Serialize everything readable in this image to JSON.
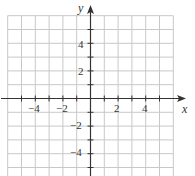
{
  "chart_data": {
    "type": "scatter",
    "title": "",
    "xlabel": "x",
    "ylabel": "y",
    "xlim": [
      -6,
      6
    ],
    "ylim": [
      -6,
      6
    ],
    "grid": true,
    "grid_step": 1,
    "x_tick_labels": [
      "-4",
      "-2",
      "2",
      "4"
    ],
    "y_tick_labels": [
      "4",
      "2",
      "-2",
      "-4"
    ],
    "x_ticks": [
      -4,
      -2,
      2,
      4
    ],
    "y_ticks": [
      4,
      2,
      -2,
      -4
    ],
    "series": [],
    "legend": null
  },
  "axes": {
    "x_label": "x",
    "y_label": "y",
    "ticks": {
      "x_neg4": "−4",
      "x_neg2": "−2",
      "x_2": "2",
      "x_4": "4",
      "y_4": "4",
      "y_2": "2",
      "y_neg2": "−2",
      "y_neg4": "−4"
    }
  },
  "colors": {
    "grid": "#c8c8c8",
    "axis": "#333333",
    "text": "#333333"
  }
}
